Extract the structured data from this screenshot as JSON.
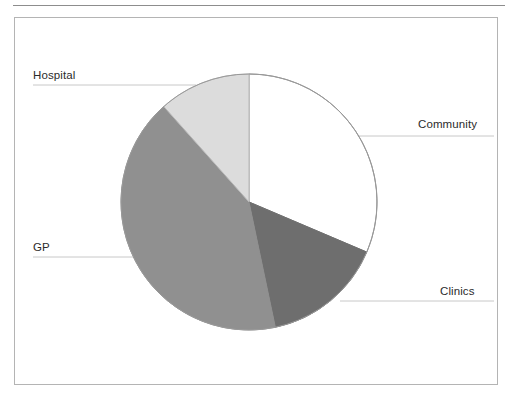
{
  "figure": {
    "background_color": "#ffffff",
    "frame": {
      "border_color": "#b4b4b4",
      "rule_color": "#8d8d8d"
    },
    "leader_line_color": "#c8c8c8",
    "slice_outline_color": "#8a8a8a"
  },
  "chart_data": {
    "type": "pie",
    "title": "",
    "subtitle": "",
    "xlabel": "",
    "ylabel": "",
    "legend_position": "none",
    "labels_position": "leader-lines",
    "grid": false,
    "start_angle_deg": 0,
    "direction": "clockwise",
    "categories": [
      "Community",
      "Clinics",
      "GP",
      "Hospital"
    ],
    "values": [
      31.4,
      15.3,
      41.7,
      11.6
    ],
    "value_unit": "percent",
    "angles_deg": [
      113,
      55,
      150,
      42
    ],
    "colors": [
      "#ffffff",
      "#6e6e6e",
      "#909090",
      "#dcdcdc"
    ],
    "slices": [
      {
        "label": "Community",
        "value": 31.4,
        "angle_deg": 113,
        "color": "#ffffff"
      },
      {
        "label": "Clinics",
        "value": 15.3,
        "angle_deg": 55,
        "color": "#6e6e6e"
      },
      {
        "label": "GP",
        "value": 41.7,
        "angle_deg": 150,
        "color": "#909090"
      },
      {
        "label": "Hospital",
        "value": 11.6,
        "angle_deg": 42,
        "color": "#dcdcdc"
      }
    ]
  },
  "labels": {
    "hospital": "Hospital",
    "community": "Community",
    "gp": "GP",
    "clinics": "Clinics"
  }
}
